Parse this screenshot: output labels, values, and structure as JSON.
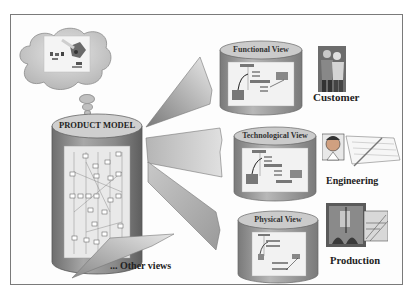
{
  "diagram": {
    "product_model": {
      "title": "PRODUCT MODEL"
    },
    "views": [
      {
        "title": "Functional View",
        "stakeholder": "Customer"
      },
      {
        "title": "Technological View",
        "stakeholder": "Engineering"
      },
      {
        "title": "Physical View",
        "stakeholder": "Production"
      }
    ],
    "other_views_label": "... Other views",
    "colors": {
      "cylinder_body": "#8e8e8e",
      "cylinder_top": "#c8c8c8",
      "beam": "#b0b0b0",
      "frame_border": "#7a7a7a",
      "text": "#222222"
    }
  }
}
